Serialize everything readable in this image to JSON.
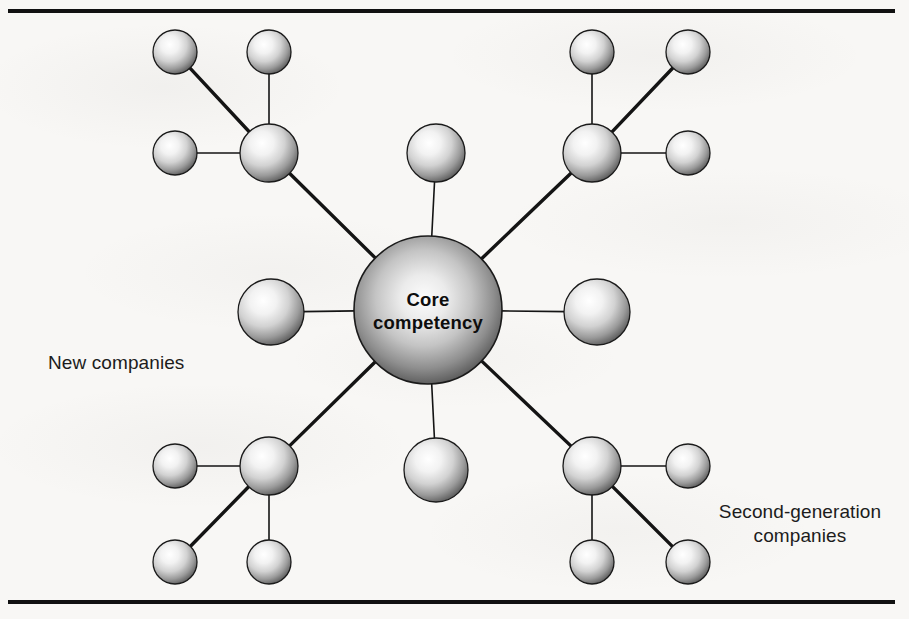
{
  "figure": {
    "background_color": "#f8f7f5",
    "rule_color": "#111111",
    "text_color": "#1c1c1c"
  },
  "core": {
    "label_line1": "Core",
    "label_line2": "competency",
    "cx": 428,
    "cy": 310,
    "r": 74
  },
  "labels": {
    "new_companies": "New companies",
    "second_generation_companies": "Second-generation\ncompanies"
  },
  "nodes": [
    {
      "id": "core",
      "kind": "core",
      "cx": 428,
      "cy": 310,
      "r": 74
    },
    {
      "id": "hub-top-left",
      "kind": "hub",
      "cx": 269,
      "cy": 153,
      "r": 29
    },
    {
      "id": "hub-top-right",
      "kind": "hub",
      "cx": 592,
      "cy": 153,
      "r": 29
    },
    {
      "id": "hub-bottom-left",
      "kind": "hub",
      "cx": 269,
      "cy": 466,
      "r": 29
    },
    {
      "id": "hub-bottom-right",
      "kind": "hub",
      "cx": 592,
      "cy": 466,
      "r": 29
    },
    {
      "id": "spoke-top",
      "kind": "spoke",
      "cx": 436,
      "cy": 153,
      "r": 29
    },
    {
      "id": "spoke-bottom",
      "kind": "spoke",
      "cx": 436,
      "cy": 470,
      "r": 32
    },
    {
      "id": "spoke-left",
      "kind": "spoke",
      "cx": 271,
      "cy": 312,
      "r": 33
    },
    {
      "id": "spoke-right",
      "kind": "spoke",
      "cx": 597,
      "cy": 312,
      "r": 33
    },
    {
      "id": "leaf-tl-a",
      "kind": "satellite",
      "cx": 175,
      "cy": 52,
      "r": 22
    },
    {
      "id": "leaf-tl-b",
      "kind": "satellite",
      "cx": 269,
      "cy": 52,
      "r": 22
    },
    {
      "id": "leaf-tl-c",
      "kind": "satellite",
      "cx": 175,
      "cy": 153,
      "r": 22
    },
    {
      "id": "leaf-tr-a",
      "kind": "satellite",
      "cx": 592,
      "cy": 52,
      "r": 22
    },
    {
      "id": "leaf-tr-b",
      "kind": "satellite",
      "cx": 688,
      "cy": 52,
      "r": 22
    },
    {
      "id": "leaf-tr-c",
      "kind": "satellite",
      "cx": 688,
      "cy": 153,
      "r": 22
    },
    {
      "id": "leaf-bl-a",
      "kind": "satellite",
      "cx": 175,
      "cy": 466,
      "r": 22
    },
    {
      "id": "leaf-bl-b",
      "kind": "satellite",
      "cx": 175,
      "cy": 562,
      "r": 22
    },
    {
      "id": "leaf-bl-c",
      "kind": "satellite",
      "cx": 269,
      "cy": 562,
      "r": 22
    },
    {
      "id": "leaf-br-a",
      "kind": "satellite",
      "cx": 688,
      "cy": 466,
      "r": 22
    },
    {
      "id": "leaf-br-b",
      "kind": "satellite",
      "cx": 592,
      "cy": 562,
      "r": 22
    },
    {
      "id": "leaf-br-c",
      "kind": "satellite",
      "cx": 688,
      "cy": 562,
      "r": 22
    }
  ],
  "edges": [
    {
      "from": "core",
      "to": "hub-top-left",
      "weight": "thick"
    },
    {
      "from": "core",
      "to": "hub-top-right",
      "weight": "thick"
    },
    {
      "from": "core",
      "to": "hub-bottom-left",
      "weight": "thick"
    },
    {
      "from": "core",
      "to": "hub-bottom-right",
      "weight": "thick"
    },
    {
      "from": "core",
      "to": "spoke-top",
      "weight": "thin"
    },
    {
      "from": "core",
      "to": "spoke-bottom",
      "weight": "thin"
    },
    {
      "from": "core",
      "to": "spoke-left",
      "weight": "thin"
    },
    {
      "from": "core",
      "to": "spoke-right",
      "weight": "thin"
    },
    {
      "from": "hub-top-left",
      "to": "leaf-tl-a",
      "weight": "thick"
    },
    {
      "from": "hub-top-left",
      "to": "leaf-tl-b",
      "weight": "thin"
    },
    {
      "from": "hub-top-left",
      "to": "leaf-tl-c",
      "weight": "thin"
    },
    {
      "from": "hub-top-right",
      "to": "leaf-tr-a",
      "weight": "thin"
    },
    {
      "from": "hub-top-right",
      "to": "leaf-tr-b",
      "weight": "thick"
    },
    {
      "from": "hub-top-right",
      "to": "leaf-tr-c",
      "weight": "thin"
    },
    {
      "from": "hub-bottom-left",
      "to": "leaf-bl-a",
      "weight": "thin"
    },
    {
      "from": "hub-bottom-left",
      "to": "leaf-bl-b",
      "weight": "thick"
    },
    {
      "from": "hub-bottom-left",
      "to": "leaf-bl-c",
      "weight": "thin"
    },
    {
      "from": "hub-bottom-right",
      "to": "leaf-br-a",
      "weight": "thin"
    },
    {
      "from": "hub-bottom-right",
      "to": "leaf-br-b",
      "weight": "thin"
    },
    {
      "from": "hub-bottom-right",
      "to": "leaf-br-c",
      "weight": "thick"
    }
  ],
  "style": {
    "sphere_highlight": "#ffffff",
    "sphere_midtone": "#c9c9c9",
    "sphere_shadow": "#3a3a3a",
    "sphere_edge": "#1a1a1a",
    "edge_color": "#141414",
    "edge_thin_width": 1.6,
    "edge_thick_width": 3.4
  }
}
